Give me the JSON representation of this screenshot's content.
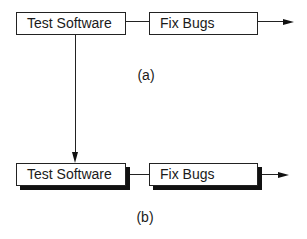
{
  "diagram_a": {
    "caption": "(a)",
    "nodes": [
      {
        "id": "test-software",
        "label": "Test Software"
      },
      {
        "id": "fix-bugs",
        "label": "Fix Bugs"
      }
    ],
    "edges": [
      {
        "from": "test-software",
        "to": "fix-bugs"
      },
      {
        "from": "fix-bugs",
        "to": "output",
        "arrow": true
      },
      {
        "from": "test-software",
        "to": "diagram_b.test-software",
        "arrow": true
      }
    ],
    "style": "plain boxes"
  },
  "diagram_b": {
    "caption": "(b)",
    "nodes": [
      {
        "id": "test-software",
        "label": "Test Software"
      },
      {
        "id": "fix-bugs",
        "label": "Fix Bugs"
      }
    ],
    "edges": [
      {
        "from": "test-software",
        "to": "fix-bugs"
      },
      {
        "from": "fix-bugs",
        "to": "output",
        "arrow": true
      }
    ],
    "style": "boxes with drop shadows"
  },
  "colors": {
    "line": "#222222",
    "shadow": "#111111",
    "background": "#ffffff"
  }
}
